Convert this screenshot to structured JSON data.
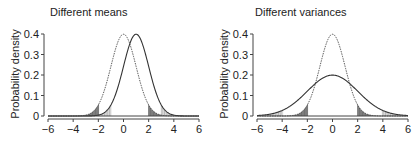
{
  "chart_data": [
    {
      "type": "line",
      "title": "Different means",
      "xlabel": "",
      "ylabel": "Probability density",
      "xlim": [
        -6,
        6
      ],
      "ylim": [
        0,
        0.4
      ],
      "xticks": [
        -6,
        -4,
        -2,
        0,
        2,
        4,
        6
      ],
      "yticks": [
        0,
        0.1,
        0.2,
        0.3,
        0.4
      ],
      "ytick_labels": [
        "0",
        "0.1",
        "0.2",
        "0.3",
        "0.4"
      ],
      "xtick_labels": [
        "−6",
        "−4",
        "−2",
        "0",
        "2",
        "4",
        "6"
      ],
      "grid": false,
      "series": [
        {
          "name": "N(0,1)",
          "mean": 0,
          "sd": 1,
          "style": "dashed",
          "peak": 0.4,
          "shaded_tails": [
            [
              -6,
              -1.96
            ],
            [
              1.96,
              6
            ]
          ],
          "shade": "dark"
        },
        {
          "name": "N(1,1)",
          "mean": 1,
          "sd": 1,
          "style": "solid",
          "peak": 0.4,
          "shaded_tails": [
            [
              -6,
              -0.96
            ],
            [
              2.96,
              6
            ]
          ],
          "shade": "light-hatched"
        }
      ]
    },
    {
      "type": "line",
      "title": "Different variances",
      "xlabel": "",
      "ylabel": "Probability density",
      "xlim": [
        -6,
        6
      ],
      "ylim": [
        0,
        0.4
      ],
      "xticks": [
        -6,
        -4,
        -2,
        0,
        2,
        4,
        6
      ],
      "yticks": [
        0,
        0.1,
        0.2,
        0.3,
        0.4
      ],
      "ytick_labels": [
        "0",
        "0.1",
        "0.2",
        "0.3",
        "0.4"
      ],
      "xtick_labels": [
        "−6",
        "−4",
        "−2",
        "0",
        "2",
        "4",
        "6"
      ],
      "grid": false,
      "series": [
        {
          "name": "N(0,1)",
          "mean": 0,
          "sd": 1,
          "style": "dashed",
          "peak": 0.4,
          "shaded_tails": [
            [
              -6,
              -1.96
            ],
            [
              1.96,
              6
            ]
          ],
          "shade": "dark"
        },
        {
          "name": "N(0,2)",
          "mean": 0,
          "sd": 2,
          "style": "solid",
          "peak": 0.2,
          "shaded_tails": [
            [
              -6,
              -3.92
            ],
            [
              3.92,
              6
            ]
          ],
          "shade": "light-hatched"
        }
      ]
    }
  ],
  "colors": {
    "axis": "#444444",
    "curve": "#333333",
    "dark_shade": "#666666",
    "light_shade": "#aaaaaa"
  }
}
